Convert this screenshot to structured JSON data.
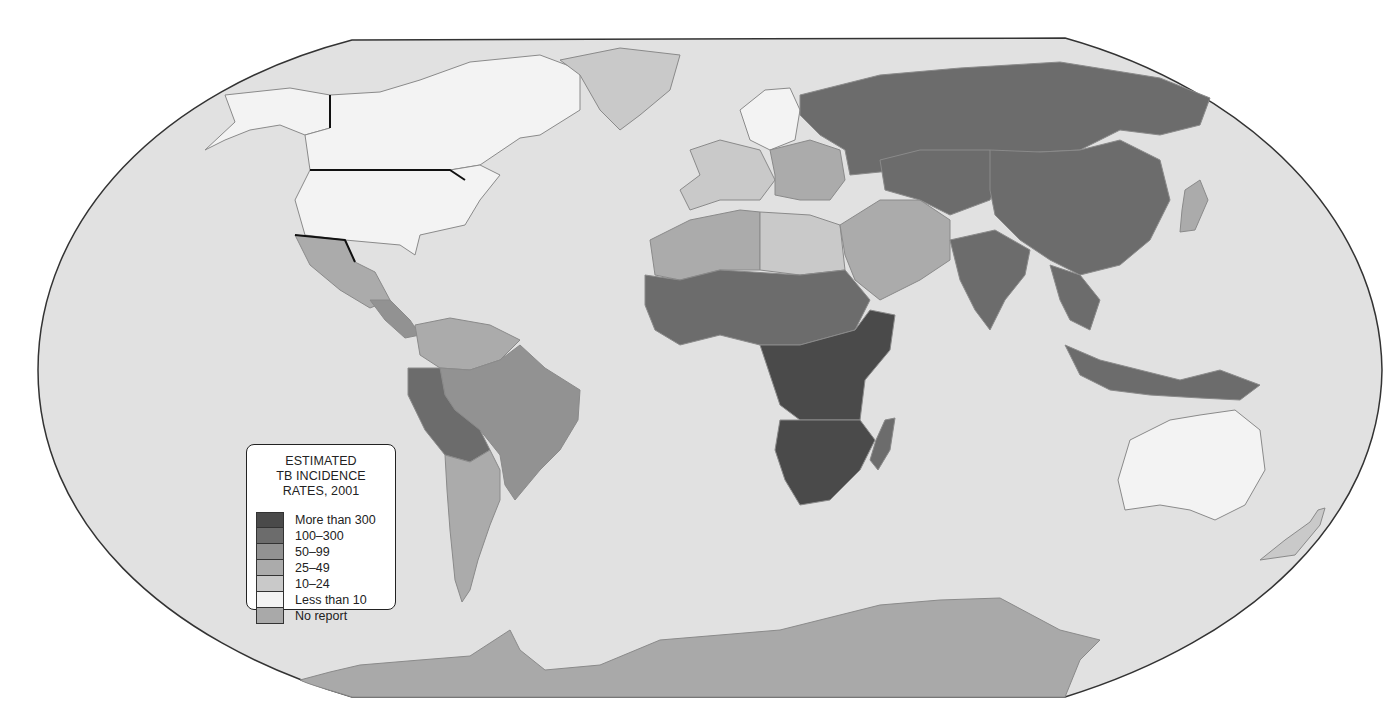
{
  "legend": {
    "title_lines": [
      "ESTIMATED",
      "TB INCIDENCE",
      "RATES, 2001"
    ],
    "items": [
      {
        "label": "More than 300",
        "color": "#4a4a4a"
      },
      {
        "label": "100–300",
        "color": "#6c6c6c"
      },
      {
        "label": "50–99",
        "color": "#929292"
      },
      {
        "label": "25–49",
        "color": "#ababab"
      },
      {
        "label": "10–24",
        "color": "#c9c9c9"
      },
      {
        "label": "Less than 10",
        "color": "#f3f3f3"
      },
      {
        "label": "No report",
        "color": "#a9a9a9"
      }
    ]
  },
  "colors": {
    "ocean": "#e1e1e1",
    "outline": "#333333",
    "page": "#ffffff"
  },
  "regions": [
    {
      "name": "canada",
      "category": 5
    },
    {
      "name": "usa",
      "category": 5
    },
    {
      "name": "alaska",
      "category": 5
    },
    {
      "name": "greenland",
      "category": 4
    },
    {
      "name": "mexico",
      "category": 3
    },
    {
      "name": "central-america",
      "category": 2
    },
    {
      "name": "colombia-venezuela",
      "category": 3
    },
    {
      "name": "brazil",
      "category": 2
    },
    {
      "name": "peru-bolivia",
      "category": 1
    },
    {
      "name": "argentina-chile",
      "category": 3
    },
    {
      "name": "western-europe",
      "category": 4
    },
    {
      "name": "scandinavia",
      "category": 5
    },
    {
      "name": "eastern-europe",
      "category": 3
    },
    {
      "name": "russia",
      "category": 1
    },
    {
      "name": "north-africa",
      "category": 3
    },
    {
      "name": "libya-egypt",
      "category": 4
    },
    {
      "name": "west-africa",
      "category": 1
    },
    {
      "name": "central-africa",
      "category": 0
    },
    {
      "name": "southern-africa",
      "category": 0
    },
    {
      "name": "madagascar",
      "category": 1
    },
    {
      "name": "middle-east",
      "category": 3
    },
    {
      "name": "central-asia",
      "category": 1
    },
    {
      "name": "china-mongolia",
      "category": 1
    },
    {
      "name": "india",
      "category": 1
    },
    {
      "name": "southeast-asia",
      "category": 1
    },
    {
      "name": "indonesia",
      "category": 1
    },
    {
      "name": "japan",
      "category": 3
    },
    {
      "name": "australia",
      "category": 5
    },
    {
      "name": "new-zealand",
      "category": 4
    },
    {
      "name": "antarctica",
      "category": 6
    }
  ]
}
